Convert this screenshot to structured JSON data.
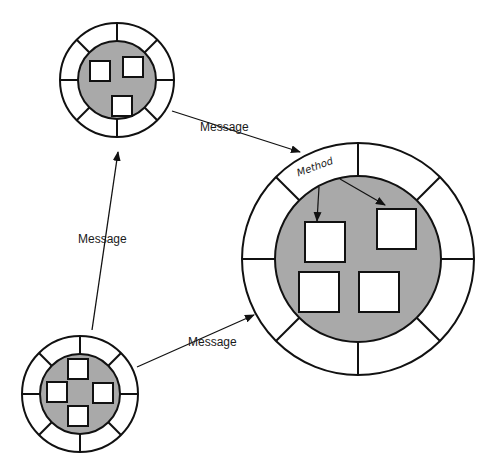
{
  "diagram": {
    "type": "object-message-passing",
    "colors": {
      "stroke": "#111111",
      "core_fill": "#a9a9a9",
      "ring_fill": "#ffffff",
      "box_fill": "#ffffff"
    },
    "objects": [
      {
        "id": "object-top-left",
        "cx": 117,
        "cy": 80,
        "outer_r": 57,
        "inner_r": 39,
        "segments": 8,
        "boxes": [
          {
            "x": 90,
            "y": 61,
            "w": 20,
            "h": 20
          },
          {
            "x": 123,
            "y": 57,
            "w": 20,
            "h": 20
          },
          {
            "x": 112,
            "y": 96,
            "w": 20,
            "h": 20
          }
        ]
      },
      {
        "id": "object-bottom-left",
        "cx": 80,
        "cy": 394,
        "outer_r": 58,
        "inner_r": 40,
        "segments": 8,
        "boxes": [
          {
            "x": 68,
            "y": 359,
            "w": 20,
            "h": 20
          },
          {
            "x": 47,
            "y": 382,
            "w": 20,
            "h": 20
          },
          {
            "x": 93,
            "y": 383,
            "w": 20,
            "h": 20
          },
          {
            "x": 68,
            "y": 406,
            "w": 20,
            "h": 20
          }
        ]
      },
      {
        "id": "object-right-large",
        "cx": 358,
        "cy": 259,
        "outer_r": 116,
        "inner_r": 83,
        "segments": 8,
        "boxes": [
          {
            "x": 305,
            "y": 222,
            "w": 40,
            "h": 40
          },
          {
            "x": 377,
            "y": 209,
            "w": 39,
            "h": 40
          },
          {
            "x": 299,
            "y": 272,
            "w": 40,
            "h": 40
          },
          {
            "x": 359,
            "y": 272,
            "w": 40,
            "h": 40
          }
        ]
      }
    ],
    "messages": [
      {
        "label": "Message",
        "from": [
          172,
          111
        ],
        "to": [
          300,
          152
        ],
        "label_x": 200,
        "label_y": 131
      },
      {
        "label": "Message",
        "from": [
          92,
          330
        ],
        "to": [
          118,
          152
        ],
        "label_x": 78,
        "label_y": 243
      },
      {
        "label": "Message",
        "from": [
          137,
          367
        ],
        "to": [
          254,
          315
        ],
        "label_x": 188,
        "label_y": 346
      }
    ],
    "method": {
      "label": "Method",
      "x": 316,
      "y": 170,
      "rotate": -20,
      "arrows": [
        {
          "from": [
            319,
            187
          ],
          "to": [
            317,
            221
          ]
        },
        {
          "from": [
            340,
            179
          ],
          "to": [
            385,
            205
          ]
        }
      ]
    }
  }
}
